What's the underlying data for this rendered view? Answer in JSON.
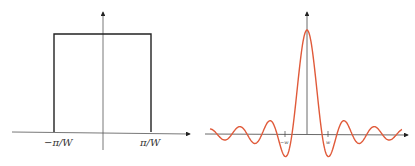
{
  "panels": [
    {
      "name": "rect-function",
      "description": "Rectangular (box) function of width 2π/W",
      "x_labels": {
        "left": "−π/W",
        "right": "π/W"
      },
      "line_color": "#222222"
    },
    {
      "name": "sinc-function",
      "description": "Sinc function, the Fourier transform of the rectangle",
      "x_labels": {
        "left": "−w",
        "right": "w"
      },
      "curve_color": "#e05a3a",
      "axis_color": "#333333"
    }
  ]
}
